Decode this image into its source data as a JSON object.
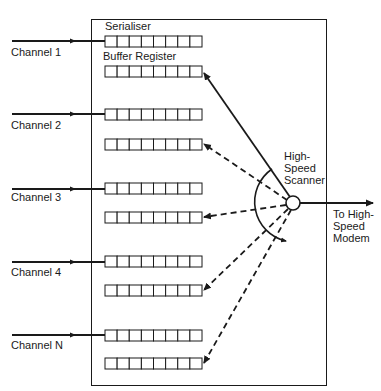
{
  "diagram": {
    "title": "",
    "labels": {
      "serialiser": "Serialiser",
      "buffer_register": "Buffer Register",
      "scanner_line1": "High-",
      "scanner_line2": "Speed",
      "scanner_line3": "Scanner",
      "output_line1": "To High-",
      "output_line2": "Speed",
      "output_line3": "Modem"
    },
    "channels": [
      {
        "label": "Channel 1"
      },
      {
        "label": "Channel 2"
      },
      {
        "label": "Channel 3"
      },
      {
        "label": "Channel 4"
      },
      {
        "label": "Channel N"
      }
    ],
    "register_cells": 8,
    "colors": {
      "line": "#1a1a1a",
      "background": "#ffffff"
    }
  }
}
